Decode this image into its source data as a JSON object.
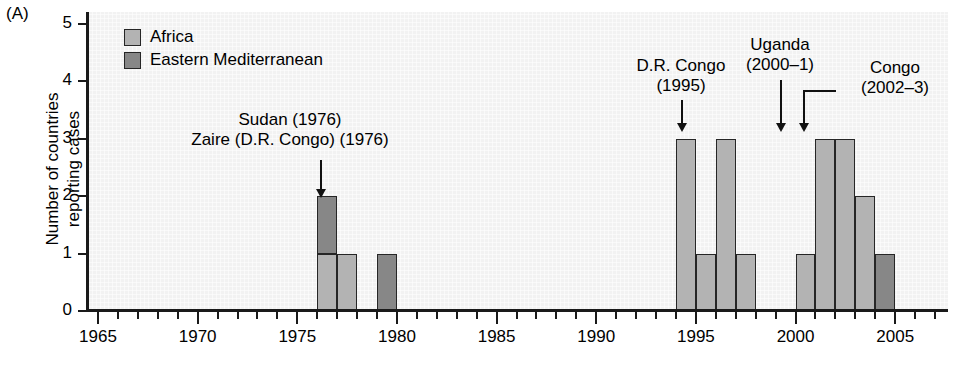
{
  "panel": {
    "label": "(A)"
  },
  "axes": {
    "y": {
      "title": "Number of countries\nreporting cases",
      "ticks": [
        "0",
        "1",
        "2",
        "3",
        "4",
        "5"
      ],
      "min": 0,
      "max": 5
    },
    "x": {
      "major_ticks": [
        "1965",
        "1970",
        "1975",
        "1980",
        "1985",
        "1990",
        "1995",
        "2000",
        "2005"
      ],
      "min": 1964,
      "max": 2007
    }
  },
  "legend": {
    "items": [
      {
        "label": "Africa",
        "color": "#b3b3b3",
        "key": "africa"
      },
      {
        "label": "Eastern Mediterranean",
        "color": "#878787",
        "key": "emed"
      }
    ]
  },
  "annotations": [
    {
      "id": "sudan-zaire-1976",
      "text": "Sudan (1976)\nZaire (D.R. Congo) (1976)",
      "target_year": 1976
    },
    {
      "id": "drcongo-1995",
      "text": "D.R. Congo\n(1995)",
      "target_year": 1995
    },
    {
      "id": "uganda-2000-1",
      "text": "Uganda\n(2000–1)",
      "target_year": 2001
    },
    {
      "id": "congo-2002-3",
      "text": "Congo\n(2002–3)",
      "target_year": 2002
    }
  ],
  "chart_data": {
    "type": "bar",
    "title": "",
    "subtitle": "",
    "xlabel": "",
    "ylabel": "Number of countries reporting cases",
    "xlim": [
      1964,
      2007
    ],
    "ylim": [
      0,
      5
    ],
    "grid": false,
    "stacked": true,
    "legend_position": "top-left",
    "categories": [
      1976,
      1977,
      1979,
      1994,
      1995,
      1996,
      1997,
      2000,
      2001,
      2002,
      2003,
      2004
    ],
    "series": [
      {
        "name": "Africa",
        "color": "#b3b3b3",
        "values": [
          1,
          1,
          0,
          3,
          1,
          3,
          1,
          1,
          3,
          3,
          2,
          0
        ]
      },
      {
        "name": "Eastern Mediterranean",
        "color": "#878787",
        "values": [
          1,
          0,
          1,
          0,
          0,
          0,
          0,
          0,
          0,
          0,
          0,
          1
        ]
      }
    ],
    "totals": [
      2,
      1,
      1,
      3,
      1,
      3,
      1,
      1,
      3,
      3,
      2,
      1
    ]
  }
}
